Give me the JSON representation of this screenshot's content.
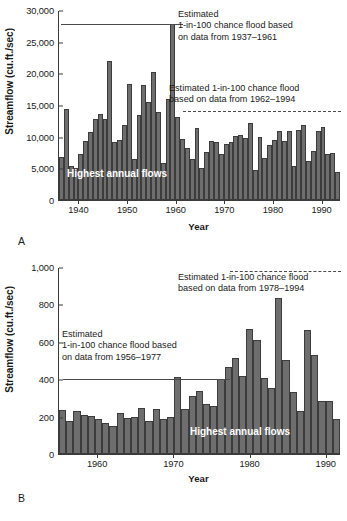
{
  "figure": {
    "panel_a_label": "A",
    "panel_b_label": "B"
  },
  "chart_data": [
    {
      "id": "panel-a",
      "type": "bar",
      "title": "",
      "xlabel": "Year",
      "ylabel": "Streamflow (cu.ft./sec)",
      "ylim": [
        0,
        30000
      ],
      "yticks": [
        0,
        5000,
        10000,
        15000,
        20000,
        25000,
        30000
      ],
      "ytick_labels": [
        "0",
        "5,000",
        "10,000",
        "15,000",
        "20,000",
        "25,000",
        "30,000"
      ],
      "xlim": [
        1936.5,
        1994.5
      ],
      "xticks": [
        1940,
        1950,
        1960,
        1970,
        1980,
        1990
      ],
      "xtick_labels": [
        "1940",
        "1950",
        "1960",
        "1970",
        "1980",
        "1990"
      ],
      "grid": false,
      "categories": [
        1937,
        1938,
        1939,
        1940,
        1941,
        1942,
        1943,
        1944,
        1945,
        1946,
        1947,
        1948,
        1949,
        1950,
        1951,
        1952,
        1953,
        1954,
        1955,
        1956,
        1957,
        1958,
        1959,
        1960,
        1961,
        1962,
        1963,
        1964,
        1965,
        1966,
        1967,
        1968,
        1969,
        1970,
        1971,
        1972,
        1973,
        1974,
        1975,
        1976,
        1977,
        1978,
        1979,
        1980,
        1981,
        1982,
        1983,
        1984,
        1985,
        1986,
        1987,
        1988,
        1989,
        1990,
        1991,
        1992,
        1993,
        1994
      ],
      "values": [
        6900,
        14400,
        5450,
        5100,
        7350,
        9300,
        10800,
        12900,
        13700,
        12800,
        22000,
        9150,
        9500,
        11900,
        18400,
        6550,
        13500,
        18200,
        15500,
        20300,
        14000,
        5900,
        16000,
        28000,
        13200,
        9700,
        8200,
        6550,
        11500,
        5150,
        7650,
        9300,
        9250,
        7250,
        8950,
        9250,
        10100,
        10300,
        9800,
        12200,
        4700,
        10000,
        6600,
        8800,
        9500,
        10900,
        9350,
        10950,
        5350,
        11050,
        11900,
        6200,
        7750,
        10950,
        11600,
        7250,
        7450,
        4500
      ],
      "annotations": [
        {
          "name": "threshold-1937-1961",
          "text": "Estimated\n1-in-100 chance flood based\non data from 1937–1961",
          "lines": [
            "Estimated",
            "1-in-100 chance flood based",
            "on data from 1937–1961"
          ],
          "value": 28000,
          "line_style": "solid",
          "span_years": [
            1937,
            1961
          ]
        },
        {
          "name": "threshold-1962-1994",
          "text": "Estimated 1-in-100 chance flood\nbased on data from 1962–1994",
          "lines": [
            "Estimated 1-in-100 chance flood",
            "based on data from 1962–1994"
          ],
          "value": 14200,
          "line_style": "dashed",
          "span_years": [
            1962,
            1994
          ]
        },
        {
          "name": "highest-annual-flows-label",
          "text": "Highest annual flows"
        }
      ]
    },
    {
      "id": "panel-b",
      "type": "bar",
      "title": "",
      "xlabel": "Year",
      "ylabel": "Streamflow (cu.ft./sec)",
      "ylim": [
        0,
        1000
      ],
      "yticks": [
        0,
        200,
        400,
        600,
        800,
        1000
      ],
      "ytick_labels": [
        "0",
        "200",
        "400",
        "600",
        "800",
        "1,000"
      ],
      "xlim": [
        1955.5,
        1992.5
      ],
      "xticks": [
        1960,
        1970,
        1980,
        1990
      ],
      "xtick_labels": [
        "1960",
        "1970",
        "1980",
        "1990"
      ],
      "grid": false,
      "categories": [
        1956,
        1957,
        1958,
        1959,
        1960,
        1961,
        1962,
        1963,
        1964,
        1965,
        1966,
        1967,
        1968,
        1969,
        1970,
        1971,
        1972,
        1973,
        1974,
        1975,
        1976,
        1977,
        1978,
        1979,
        1980,
        1981,
        1982,
        1983,
        1984,
        1985,
        1986,
        1987,
        1988,
        1989,
        1990,
        1991,
        1992
      ],
      "values": [
        237,
        175,
        230,
        212,
        203,
        188,
        167,
        150,
        219,
        192,
        197,
        250,
        178,
        243,
        190,
        200,
        413,
        244,
        312,
        340,
        270,
        258,
        402,
        466,
        518,
        418,
        672,
        613,
        406,
        353,
        837,
        504,
        333,
        231,
        665,
        533,
        283,
        283,
        188
      ],
      "annotations": [
        {
          "name": "threshold-1978-1994",
          "text": "Estimated 1-in-100 chance flood\nbased on data from 1978–1994",
          "lines": [
            "Estimated 1-in-100 chance flood",
            "based on data from 1978–1994"
          ],
          "value": 985,
          "line_style": "dashed",
          "span_years": [
            1978,
            1994
          ]
        },
        {
          "name": "threshold-1956-1977",
          "text": "Estimated\n1-in-100 chance flood based\non data from 1956–1977",
          "lines": [
            "Estimated",
            "1-in-100 chance flood based",
            "on data from 1956–1977"
          ],
          "value": 408,
          "line_style": "solid",
          "span_years": [
            1956,
            1977
          ]
        },
        {
          "name": "highest-annual-flows-label",
          "text": "Highest annual flows"
        }
      ]
    }
  ]
}
